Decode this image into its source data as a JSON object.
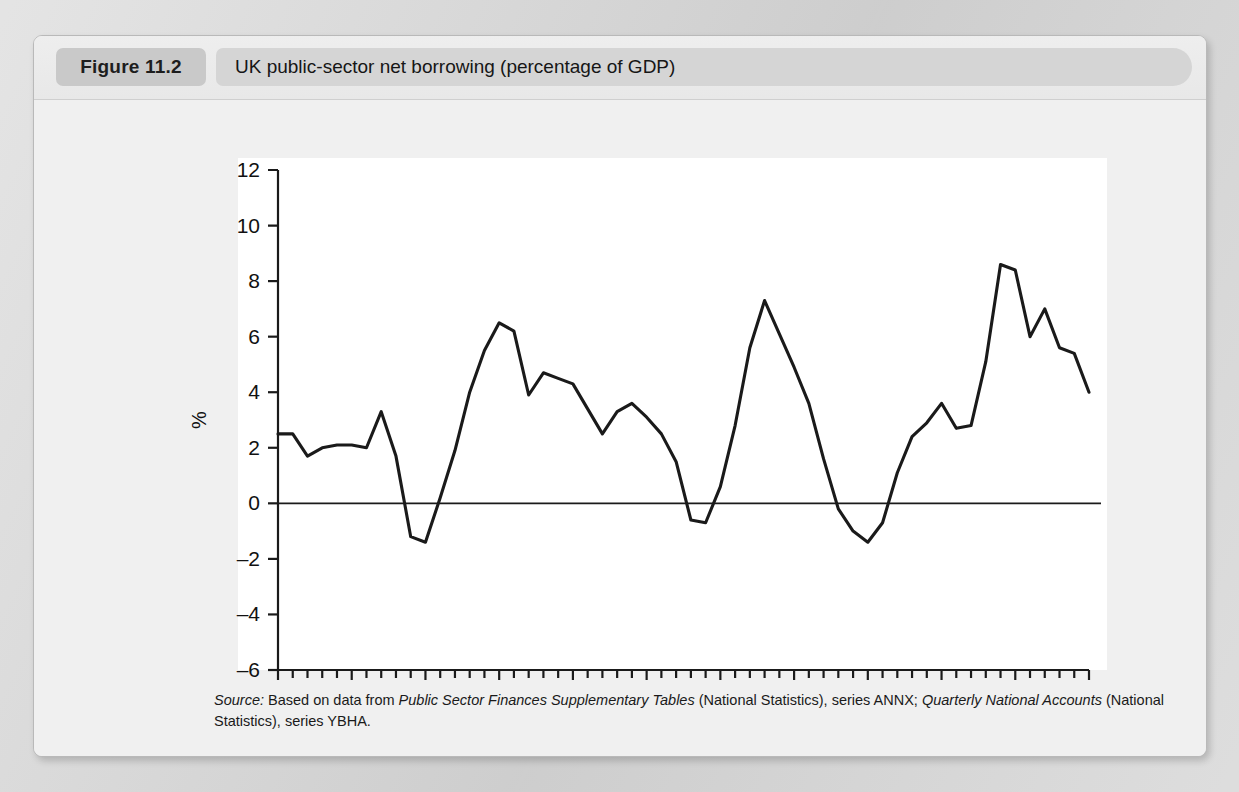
{
  "figure": {
    "number": "Figure 11.2",
    "title": "UK public-sector net borrowing (percentage of GDP)"
  },
  "source": {
    "label": "Source:",
    "text_1": " Based on data from ",
    "italic_1": "Public Sector Finances Supplementary Tables",
    "text_2": " (National Statistics), series ANNX; ",
    "italic_2": "Quarterly National Accounts",
    "text_3": " (National Statistics), series YBHA."
  },
  "colors": {
    "card_background": "#efefef",
    "header_badge": "#c9c9c9",
    "title_bar": "#d5d5d5",
    "plot_background": "#ffffff",
    "line": "#1a1a1a",
    "axis": "#1a1a1a",
    "page_background": "#d6d6d6"
  },
  "chart_data": {
    "type": "line",
    "title": "UK public-sector net borrowing (percentage of GDP)",
    "xlabel": "",
    "ylabel": "%",
    "xlim": [
      1960,
      2015
    ],
    "ylim": [
      -6,
      12
    ],
    "ytick_step": 2,
    "yticks": [
      12,
      10,
      8,
      6,
      4,
      2,
      0,
      -2,
      -4,
      -6
    ],
    "xticks": [
      1960,
      1965,
      1970,
      1975,
      1980,
      1985,
      1990,
      1995,
      2000,
      2005,
      2010,
      2015
    ],
    "xtick_minor_step": 1,
    "grid": false,
    "legend": "none",
    "zero_line": true,
    "series": [
      {
        "name": "Public-sector net borrowing (% of GDP)",
        "x": [
          1960,
          1961,
          1962,
          1963,
          1964,
          1965,
          1966,
          1967,
          1968,
          1969,
          1970,
          1971,
          1972,
          1973,
          1974,
          1975,
          1976,
          1977,
          1978,
          1979,
          1980,
          1981,
          1982,
          1983,
          1984,
          1985,
          1986,
          1987,
          1988,
          1989,
          1990,
          1991,
          1992,
          1993,
          1994,
          1995,
          1996,
          1997,
          1998,
          1999,
          2000,
          2001,
          2002,
          2003,
          2004,
          2005,
          2006,
          2007,
          2008,
          2009,
          2010,
          2011,
          2012,
          2013,
          2014,
          2015
        ],
        "y": [
          2.5,
          2.5,
          1.7,
          2.0,
          2.1,
          2.1,
          2.0,
          3.3,
          1.7,
          -1.2,
          -1.4,
          0.2,
          1.9,
          4.0,
          5.5,
          6.5,
          6.2,
          3.9,
          4.7,
          4.5,
          4.3,
          3.4,
          2.5,
          3.3,
          3.6,
          3.1,
          2.5,
          1.5,
          -0.6,
          -0.7,
          0.6,
          2.8,
          5.6,
          7.3,
          6.1,
          4.9,
          3.6,
          1.6,
          -0.2,
          -1.0,
          -1.4,
          -0.7,
          1.1,
          2.4,
          2.9,
          3.6,
          2.7,
          2.8,
          5.1,
          8.6,
          8.4,
          6.0,
          7.0,
          5.6,
          5.4,
          4.0
        ]
      }
    ]
  },
  "plot_geometry": {
    "note": "mapping used by the renderer",
    "x_axis_start_px": 244,
    "x_axis_end_px": 1055,
    "y_top_px": 133,
    "y_bottom_px": 633
  }
}
